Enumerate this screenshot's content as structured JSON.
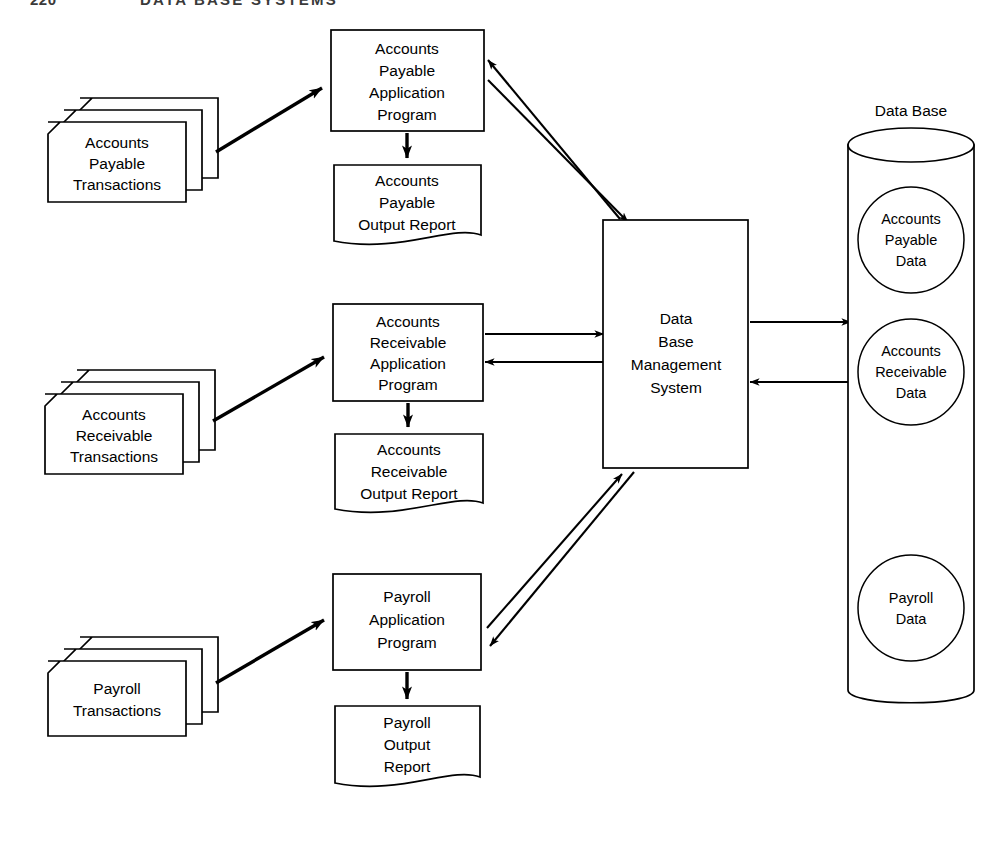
{
  "header": {
    "page_number": "220",
    "title": "DATA BASE SYSTEMS"
  },
  "diagram": {
    "type": "data-flow-diagram",
    "colors": {
      "stroke": "#000000",
      "fill": "#ffffff",
      "header_text": "#3a3a3a"
    },
    "transaction_stacks": [
      {
        "id": "ap-transactions",
        "lines": [
          "Accounts",
          "Payable",
          "Transactions"
        ],
        "shape": "punched-card-stack",
        "count": 3
      },
      {
        "id": "ar-transactions",
        "lines": [
          "Accounts",
          "Receivable",
          "Transactions"
        ],
        "shape": "punched-card-stack",
        "count": 3
      },
      {
        "id": "pr-transactions",
        "lines": [
          "Payroll",
          "Transactions"
        ],
        "shape": "punched-card-stack",
        "count": 3
      }
    ],
    "application_programs": [
      {
        "id": "ap-program",
        "lines": [
          "Accounts",
          "Payable",
          "Application",
          "Program"
        ],
        "shape": "rectangle"
      },
      {
        "id": "ar-program",
        "lines": [
          "Accounts",
          "Receivable",
          "Application",
          "Program"
        ],
        "shape": "rectangle"
      },
      {
        "id": "pr-program",
        "lines": [
          "Payroll",
          "Application",
          "Program"
        ],
        "shape": "rectangle"
      }
    ],
    "output_reports": [
      {
        "id": "ap-report",
        "lines": [
          "Accounts",
          "Payable",
          "Output Report"
        ],
        "shape": "document"
      },
      {
        "id": "ar-report",
        "lines": [
          "Accounts",
          "Receivable",
          "Output Report"
        ],
        "shape": "document"
      },
      {
        "id": "pr-report",
        "lines": [
          "Payroll",
          "Output",
          "Report"
        ],
        "shape": "document"
      }
    ],
    "dbms": {
      "id": "dbms",
      "lines": [
        "Data",
        "Base",
        "Management",
        "System"
      ],
      "shape": "rectangle"
    },
    "database": {
      "id": "database",
      "caption": "Data Base",
      "shape": "cylinder",
      "data_stores": [
        {
          "id": "ap-data",
          "lines": [
            "Accounts",
            "Payable",
            "Data"
          ],
          "shape": "circle"
        },
        {
          "id": "ar-data",
          "lines": [
            "Accounts",
            "Receivable",
            "Data"
          ],
          "shape": "circle"
        },
        {
          "id": "pr-data",
          "lines": [
            "Payroll",
            "Data"
          ],
          "shape": "circle"
        }
      ]
    },
    "connections": [
      {
        "id": "ap-trans-to-program",
        "from": "ap-transactions",
        "to": "ap-program",
        "style": "thick",
        "direction": "one-way"
      },
      {
        "id": "ar-trans-to-program",
        "from": "ar-transactions",
        "to": "ar-program",
        "style": "thick",
        "direction": "one-way"
      },
      {
        "id": "pr-trans-to-program",
        "from": "pr-transactions",
        "to": "pr-program",
        "style": "thick",
        "direction": "one-way"
      },
      {
        "id": "ap-program-to-report",
        "from": "ap-program",
        "to": "ap-report",
        "style": "thick",
        "direction": "one-way"
      },
      {
        "id": "ar-program-to-report",
        "from": "ar-program",
        "to": "ar-report",
        "style": "thick",
        "direction": "one-way"
      },
      {
        "id": "pr-program-to-report",
        "from": "pr-program",
        "to": "pr-report",
        "style": "thick",
        "direction": "one-way"
      },
      {
        "id": "ap-program-to-dbms",
        "from": "ap-program",
        "to": "dbms",
        "style": "thin",
        "direction": "bidirectional"
      },
      {
        "id": "ar-program-to-dbms",
        "from": "ar-program",
        "to": "dbms",
        "style": "thin",
        "direction": "bidirectional"
      },
      {
        "id": "pr-program-to-dbms",
        "from": "pr-program",
        "to": "dbms",
        "style": "thin",
        "direction": "bidirectional"
      },
      {
        "id": "dbms-to-database",
        "from": "dbms",
        "to": "database",
        "style": "thin",
        "direction": "bidirectional"
      }
    ]
  }
}
